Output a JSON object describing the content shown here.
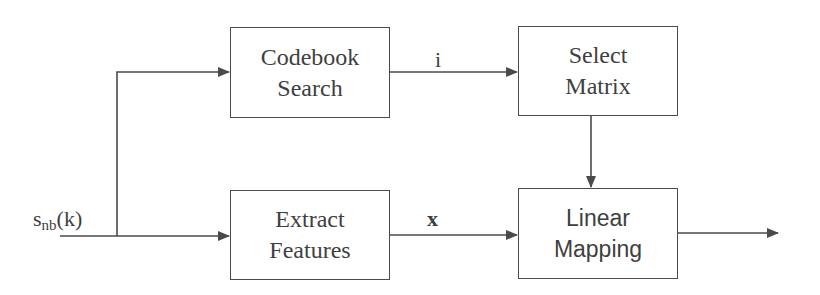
{
  "diagram": {
    "type": "block-diagram",
    "input_signal": {
      "base": "s",
      "subscript": "nb",
      "argument": "(k)"
    },
    "blocks": [
      {
        "id": "codebook_search",
        "line1": "Codebook",
        "line2": "Search"
      },
      {
        "id": "select_matrix",
        "line1": "Select",
        "line2": "Matrix"
      },
      {
        "id": "extract_features",
        "line1": "Extract",
        "line2": "Features"
      },
      {
        "id": "linear_mapping",
        "line1": "Linear",
        "line2": "Mapping"
      }
    ],
    "edge_labels": {
      "index": "i",
      "features": "x"
    },
    "edges": [
      {
        "from": "input",
        "to": "codebook_search"
      },
      {
        "from": "input",
        "to": "extract_features"
      },
      {
        "from": "codebook_search",
        "to": "select_matrix",
        "label": "i"
      },
      {
        "from": "extract_features",
        "to": "linear_mapping",
        "label": "x"
      },
      {
        "from": "select_matrix",
        "to": "linear_mapping"
      },
      {
        "from": "linear_mapping",
        "to": "output"
      }
    ],
    "colors": {
      "stroke": "#4a4a4a",
      "text": "#3f3f3f",
      "background": "#ffffff"
    }
  }
}
